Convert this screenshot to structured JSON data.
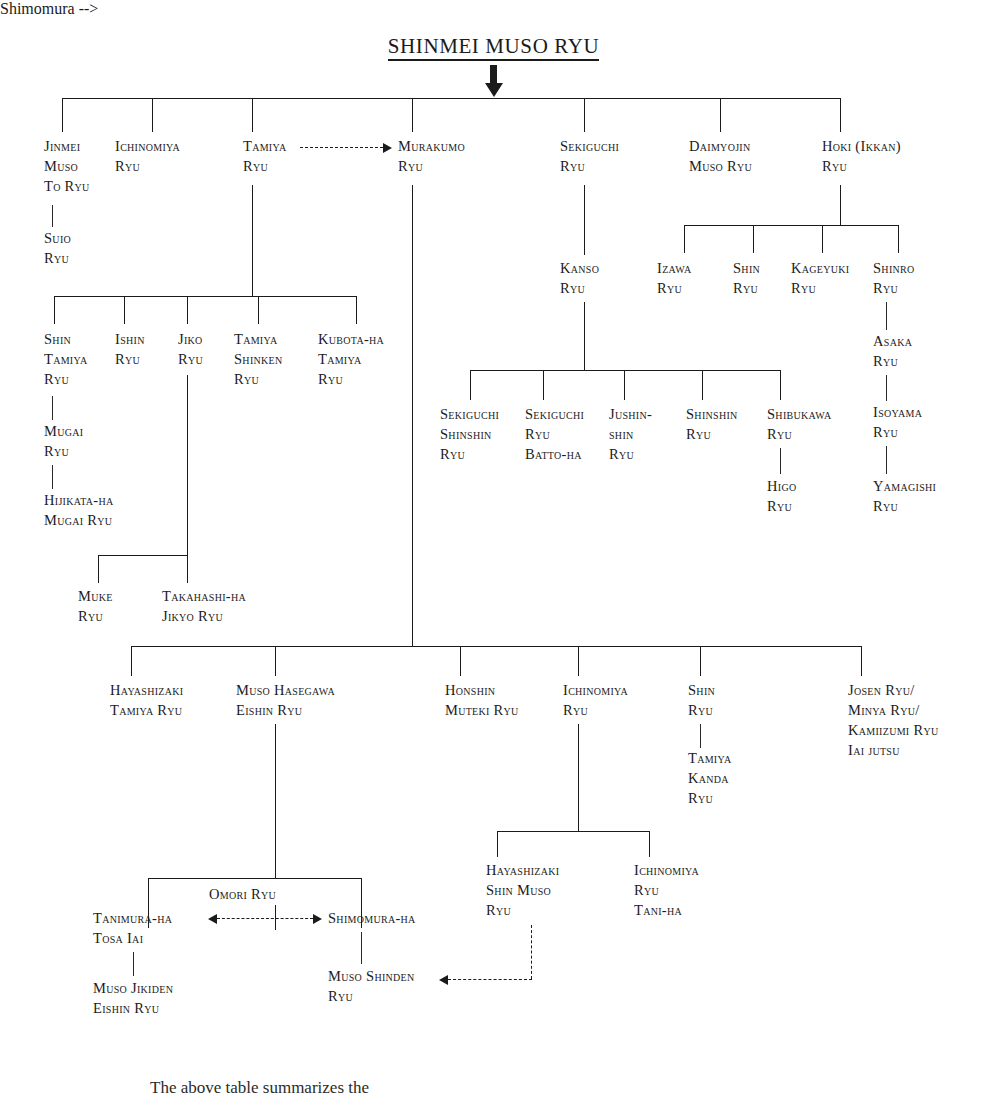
{
  "diagram": {
    "title": "SHINMEI MUSO RYU",
    "type": "lineage-tree",
    "root_arrow": "down-arrow-icon",
    "bottom_partial_text": "The above table summarizes the"
  },
  "nodes": {
    "jinmei_muso_to_ryu": [
      "Jinmei",
      "Muso",
      "To Ryu"
    ],
    "suio_ryu": [
      "Suio",
      "Ryu"
    ],
    "ichinomiya_ryu_top": [
      "Ichinomiya",
      "Ryu"
    ],
    "tamiya_ryu": [
      "Tamiya",
      "Ryu"
    ],
    "murakumo_ryu": [
      "Murakumo",
      "Ryu"
    ],
    "sekiguchi_ryu": [
      "Sekiguchi",
      "Ryu"
    ],
    "kanso_ryu": [
      "Kanso",
      "Ryu"
    ],
    "daimyojin_muso_ryu": [
      "Daimyojin",
      "Muso Ryu"
    ],
    "hoki_ikkan_ryu": [
      "Hoki (Ikkan)",
      "Ryu"
    ],
    "izawa_ryu": [
      "Izawa",
      "Ryu"
    ],
    "shin_ryu_hoki": [
      "Shin",
      "Ryu"
    ],
    "kageyuki_ryu": [
      "Kageyuki",
      "Ryu"
    ],
    "shinro_ryu": [
      "Shinro",
      "Ryu"
    ],
    "asaka_ryu": [
      "Asaka",
      "Ryu"
    ],
    "isoyama_ryu": [
      "Isoyama",
      "Ryu"
    ],
    "yamagishi_ryu": [
      "Yamagishi",
      "Ryu"
    ],
    "shin_tamiya_ryu": [
      "Shin",
      "Tamiya",
      "Ryu"
    ],
    "mugai_ryu": [
      "Mugai",
      "Ryu"
    ],
    "hijikata_ha_mugai_ryu": [
      "Hijikata-ha",
      "Mugai Ryu"
    ],
    "ishin_ryu": [
      "Ishin",
      "Ryu"
    ],
    "jiko_ryu": [
      "Jiko",
      "Ryu"
    ],
    "tamiya_shinken_ryu": [
      "Tamiya",
      "Shinken",
      "Ryu"
    ],
    "kubota_ha_tamiya_ryu": [
      "Kubota-ha",
      "Tamiya",
      "Ryu"
    ],
    "muke_ryu": [
      "Muke",
      "Ryu"
    ],
    "takahashi_ha_jikyo_ryu": [
      "Takahashi-ha",
      "Jikyo Ryu"
    ],
    "sekiguchi_shinshin_ryu": [
      "Sekiguchi",
      "Shinshin",
      "Ryu"
    ],
    "sekiguchi_ryu_batto_ha": [
      "Sekiguchi",
      "Ryu",
      "Batto-ha"
    ],
    "jushinshin_ryu": [
      "Jushin-",
      "shin",
      "Ryu"
    ],
    "shinshin_ryu": [
      "Shinshin",
      "Ryu"
    ],
    "shibukawa_ryu": [
      "Shibukawa",
      "Ryu"
    ],
    "higo_ryu": [
      "Higo",
      "Ryu"
    ],
    "hayashizaki_tamiya_ryu": [
      "Hayashizaki",
      "Tamiya Ryu"
    ],
    "muso_hasegawa_eishin_ryu": [
      "Muso Hasegawa",
      "Eishin Ryu"
    ],
    "honshin_muteki_ryu": [
      "Honshin",
      "Muteki Ryu"
    ],
    "ichinomiya_ryu_mid": [
      "Ichinomiya",
      "Ryu"
    ],
    "shin_ryu_mid": [
      "Shin",
      "Ryu"
    ],
    "tamiya_kanda_ryu": [
      "Tamiya",
      "Kanda",
      "Ryu"
    ],
    "josen_minya_kamiizumi": [
      "Josen Ryu/",
      "Minya Ryu/",
      "Kamiizumi Ryu",
      "Iai jutsu"
    ],
    "hayashizaki_shin_muso_ryu": [
      "Hayashizaki",
      "Shin Muso",
      "Ryu"
    ],
    "ichinomiya_ryu_tani_ha": [
      "Ichinomiya",
      "Ryu",
      "Tani-ha"
    ],
    "omori_ryu": [
      "Omori Ryu"
    ],
    "tanimura_ha_tosa_iai": [
      "Tanimura-ha",
      "Tosa Iai"
    ],
    "muso_jikiden_eishin_ryu": [
      "Muso Jikiden",
      "Eishin Ryu"
    ],
    "shimomura_ha": [
      "Shimomura-ha"
    ],
    "muso_shinden_ryu": [
      "Muso Shinden",
      "Ryu"
    ]
  },
  "colors": {
    "ink": "#1b1b1b",
    "background": "#ffffff"
  }
}
